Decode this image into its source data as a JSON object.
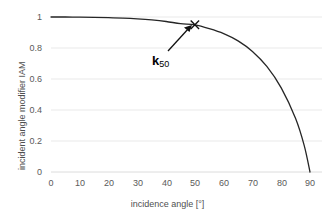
{
  "chart_data": {
    "type": "line",
    "title": "",
    "xlabel": "incidence angle [°]",
    "ylabel": "incident angle modifier IAM",
    "xlim": [
      0,
      90
    ],
    "ylim": [
      0,
      1
    ],
    "xticks": [
      "0",
      "10",
      "20",
      "30",
      "40",
      "50",
      "60",
      "70",
      "80",
      "90"
    ],
    "yticks": [
      "1",
      "0.8",
      "0.6",
      "0.4",
      "0.2",
      "0"
    ],
    "grid": "horizontal",
    "legend": "none",
    "series": [
      {
        "name": "IAM",
        "x": [
          0,
          5,
          10,
          15,
          20,
          25,
          30,
          35,
          40,
          45,
          50,
          55,
          60,
          65,
          70,
          75,
          80,
          85,
          88,
          90
        ],
        "values": [
          1.0,
          1.0,
          0.999,
          0.998,
          0.996,
          0.993,
          0.988,
          0.981,
          0.971,
          0.957,
          0.949,
          0.925,
          0.893,
          0.846,
          0.778,
          0.681,
          0.543,
          0.345,
          0.17,
          0.0
        ]
      }
    ],
    "annotations": [
      {
        "label": "k",
        "subscript": "50",
        "marker": "x",
        "marker_x": 50,
        "marker_y": 0.95,
        "arrow": "points up-right from label to marker"
      }
    ],
    "colors": {
      "curve": "#262626",
      "grid": "#e8e8e8",
      "text": "#5a5a5a",
      "annotation": "#000000",
      "background": "#ffffff"
    }
  }
}
